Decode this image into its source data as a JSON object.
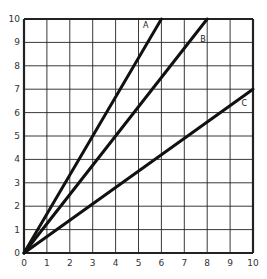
{
  "chart_data": {
    "type": "line",
    "title": "",
    "xlabel": "",
    "ylabel": "",
    "xlim": [
      0,
      10
    ],
    "ylim": [
      0,
      10
    ],
    "grid": true,
    "x_ticks": [
      "0",
      "1",
      "2",
      "3",
      "4",
      "5",
      "6",
      "7",
      "8",
      "9",
      "10"
    ],
    "y_ticks": [
      "0",
      "1",
      "2",
      "3",
      "4",
      "5",
      "6",
      "7",
      "8",
      "9",
      "10"
    ],
    "series": [
      {
        "name": "A",
        "x": [
          0,
          6
        ],
        "y": [
          0,
          10
        ]
      },
      {
        "name": "B",
        "x": [
          0,
          8
        ],
        "y": [
          0,
          10
        ]
      },
      {
        "name": "C",
        "x": [
          0,
          10
        ],
        "y": [
          0,
          7
        ]
      }
    ],
    "annotations": [
      {
        "text": "A",
        "x": 5.2,
        "y": 9.6
      },
      {
        "text": "B",
        "x": 7.7,
        "y": 9.0
      },
      {
        "text": "C",
        "x": 9.5,
        "y": 6.3
      }
    ]
  },
  "colors": {
    "line": "#111111",
    "grid": "#222222",
    "background": "#ffffff"
  }
}
